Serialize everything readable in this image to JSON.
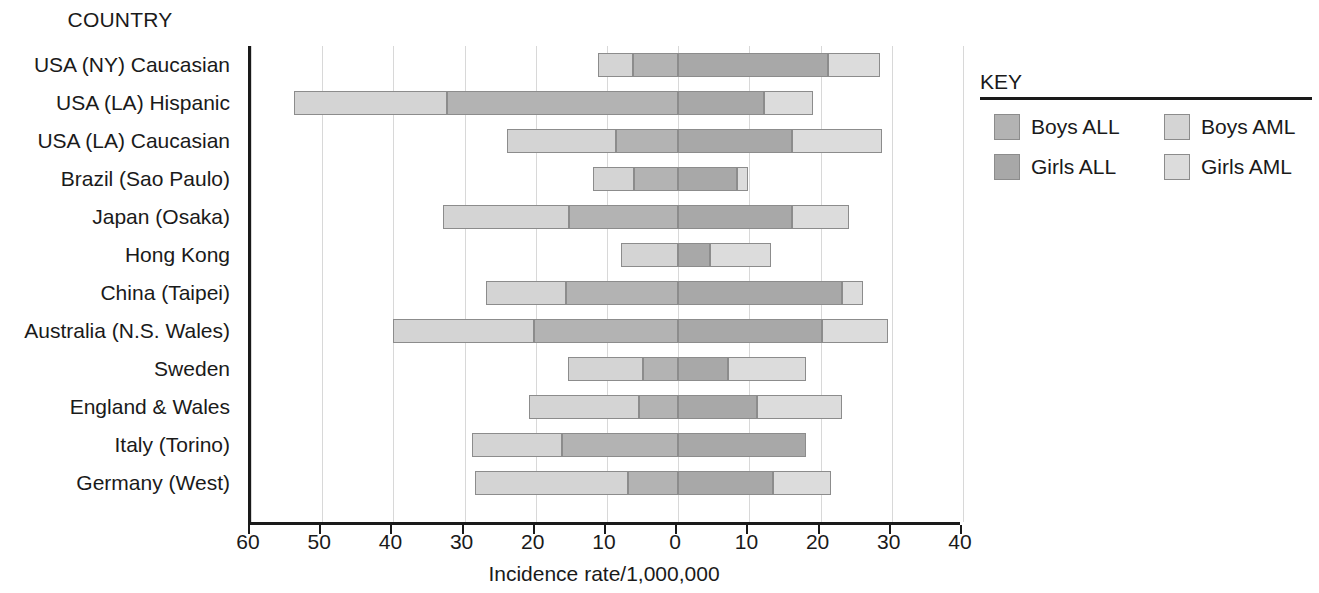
{
  "headings": {
    "country_column": "COUNTRY"
  },
  "legend": {
    "title": "KEY",
    "items": [
      {
        "label": "Boys ALL",
        "key": "boys_all",
        "color": "#b3b3b3"
      },
      {
        "label": "Boys AML",
        "key": "boys_aml",
        "color": "#d4d4d4"
      },
      {
        "label": "Girls ALL",
        "key": "girls_all",
        "color": "#a8a8a8"
      },
      {
        "label": "Girls AML",
        "key": "girls_aml",
        "color": "#dcdcdc"
      }
    ]
  },
  "chart_data": {
    "type": "bar",
    "orientation": "horizontal",
    "stacked": true,
    "diverging": true,
    "title": "",
    "xlabel": "Incidence rate/1,000,000",
    "ylabel": "COUNTRY",
    "grid": true,
    "legend_position": "right",
    "xlim": [
      -60,
      40
    ],
    "left_axis_direction": "negative-is-left",
    "xticks": [
      -60,
      -50,
      -40,
      -30,
      -20,
      -10,
      0,
      10,
      20,
      30,
      40
    ],
    "xtick_labels": [
      "60",
      "50",
      "40",
      "30",
      "20",
      "10",
      "0",
      "10",
      "20",
      "30",
      "40"
    ],
    "categories": [
      "USA (NY) Caucasian",
      "USA (LA) Hispanic",
      "USA (LA) Caucasian",
      "Brazil (Sao Paulo)",
      "Japan (Osaka)",
      "Hong Kong",
      "China (Taipei)",
      "Australia (N.S. Wales)",
      "Sweden",
      "England & Wales",
      "Italy (Torino)",
      "Germany (West)"
    ],
    "series": [
      {
        "name": "Boys ALL",
        "side": "left",
        "values": [
          6.4,
          32.5,
          8.8,
          6.2,
          15.3,
          0.0,
          15.8,
          20.2,
          5.0,
          5.5,
          16.3,
          7.0
        ]
      },
      {
        "name": "Boys AML",
        "side": "left",
        "values": [
          4.8,
          21.5,
          15.2,
          5.8,
          17.7,
          8.0,
          11.2,
          19.8,
          10.5,
          15.5,
          12.7,
          21.5
        ]
      },
      {
        "name": "Girls ALL",
        "side": "right",
        "values": [
          21.0,
          12.0,
          16.0,
          8.3,
          16.0,
          4.5,
          23.0,
          20.2,
          7.0,
          11.0,
          18.0,
          13.3
        ]
      },
      {
        "name": "Girls AML",
        "side": "right",
        "values": [
          7.4,
          7.0,
          12.6,
          1.5,
          8.0,
          8.5,
          3.0,
          9.3,
          11.0,
          12.0,
          0.0,
          8.2
        ]
      }
    ]
  }
}
